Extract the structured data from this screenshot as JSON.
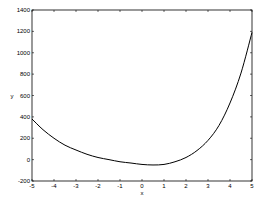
{
  "chart_data": {
    "type": "line",
    "title": "",
    "xlabel": "x",
    "ylabel": "y",
    "xlim": [
      -5,
      5
    ],
    "ylim": [
      -200,
      1400
    ],
    "grid": false,
    "legend": null,
    "x_ticks": [
      -5,
      -4,
      -3,
      -2,
      -1,
      0,
      1,
      2,
      3,
      4,
      5
    ],
    "x_tick_labels": [
      "-5",
      "-4",
      "-3",
      "-2",
      "-1",
      "0",
      "1",
      "2",
      "3",
      "4",
      "5"
    ],
    "y_ticks": [
      -200,
      0,
      200,
      400,
      600,
      800,
      1000,
      1200,
      1400
    ],
    "y_tick_labels": [
      "-200",
      "0",
      "200",
      "400",
      "600",
      "800",
      "1000",
      "1200",
      "1400"
    ],
    "series": [
      {
        "name": "y",
        "color": "#000000",
        "x": [
          -5,
          -4.5,
          -4,
          -3.5,
          -3,
          -2.5,
          -2,
          -1.5,
          -1,
          -0.5,
          0,
          0.5,
          1,
          1.5,
          2,
          2.5,
          3,
          3.5,
          4,
          4.5,
          5
        ],
        "values": [
          380,
          280,
          200,
          135,
          90,
          50,
          20,
          0,
          -20,
          -32,
          -45,
          -50,
          -45,
          -20,
          20,
          85,
          180,
          320,
          530,
          810,
          1190
        ]
      }
    ]
  }
}
